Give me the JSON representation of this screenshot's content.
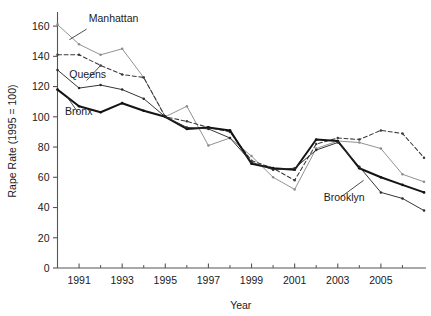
{
  "chart_data": {
    "type": "line",
    "title": "",
    "xlabel": "Year",
    "ylabel": "Rape Rate (1995 = 100)",
    "xlim": [
      1990,
      2007
    ],
    "ylim": [
      0,
      168
    ],
    "grid": false,
    "legend_position": "inline-annotations",
    "x": [
      1990,
      1991,
      1992,
      1993,
      1994,
      1995,
      1996,
      1997,
      1998,
      1999,
      2000,
      2001,
      2002,
      2003,
      2004,
      2005,
      2006,
      2007
    ],
    "xticks_major": [
      1991,
      1993,
      1995,
      1997,
      1999,
      2001,
      2003,
      2005
    ],
    "xticks_major_labels": [
      "1991",
      "1993",
      "1995",
      "1997",
      "1999",
      "2001",
      "2003",
      "2005"
    ],
    "xticks_minor": [
      1990,
      1992,
      1994,
      1996,
      1998,
      2000,
      2002,
      2004,
      2006
    ],
    "yticks": [
      0,
      20,
      40,
      60,
      80,
      100,
      120,
      140,
      160
    ],
    "ytick_labels": [
      "0",
      "20",
      "40",
      "60",
      "80",
      "100",
      "120",
      "140",
      "160"
    ],
    "series": [
      {
        "name": "Manhattan",
        "style": "solid-light",
        "color": "#8c8c8c",
        "marker": "dot",
        "label_x": 1991.45,
        "label_y": 163,
        "values": [
          161,
          148,
          141,
          145,
          126,
          100,
          107,
          81,
          86,
          74,
          60,
          52,
          79,
          84,
          83,
          79,
          62,
          57
        ]
      },
      {
        "name": "Queens",
        "style": "dashed",
        "color": "#3a3a3a",
        "marker": "dot",
        "label_x": 1990.55,
        "label_y": 126,
        "values": [
          141,
          141,
          134,
          128,
          126,
          100,
          97,
          93,
          90,
          71,
          66,
          58,
          82,
          86,
          85,
          91,
          89,
          73
        ]
      },
      {
        "name": "Bronx",
        "style": "solid-bold",
        "color": "#141414",
        "marker": "dot",
        "label_x": 1990.35,
        "label_y": 101,
        "values": [
          118,
          107,
          103,
          109,
          104,
          100,
          92,
          93,
          91,
          69,
          66,
          65,
          85,
          84,
          66,
          60,
          55,
          50
        ]
      },
      {
        "name": "Brooklyn",
        "style": "solid-thin",
        "color": "#2a2a2a",
        "marker": "dot",
        "label_x": 2002.35,
        "label_y": 44,
        "values": [
          131,
          119,
          121,
          118,
          112,
          100,
          93,
          92,
          86,
          70,
          65,
          66,
          78,
          83,
          67,
          50,
          46,
          38
        ]
      }
    ],
    "annotations": [
      {
        "text": "Manhattan",
        "leader_from": [
          1991.35,
          158
        ],
        "leader_to": [
          1990.55,
          151
        ]
      },
      {
        "text": "Queens",
        "leader_from": [
          1991.35,
          124
        ],
        "leader_to": [
          1992.0,
          134
        ]
      },
      {
        "text": "Bronx",
        "leader_from": [
          1990.95,
          103
        ],
        "leader_to": [
          1990.45,
          113
        ]
      },
      {
        "text": "Brooklyn",
        "leader_from": [
          2003.15,
          47
        ],
        "leader_to": [
          2004.2,
          58
        ]
      }
    ]
  },
  "figure": {
    "axis_color": "#555555",
    "text_color": "#1a1a1a",
    "background": "#ffffff"
  }
}
